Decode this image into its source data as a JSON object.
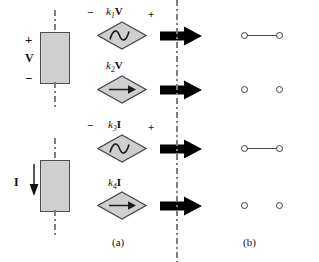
{
  "figure": {
    "captions": [
      {
        "name": "caption-a",
        "text": "(a)",
        "x": 112,
        "y": 236
      },
      {
        "name": "caption-b",
        "text": "(b)",
        "x": 243,
        "y": 236
      }
    ],
    "divider": {
      "name": "vertical-dash-dot-divider",
      "x": 176,
      "color": "#7d7d7d"
    }
  },
  "excitations": [
    {
      "name": "voltage-excitation-block",
      "quantity_label": "V",
      "plus_sign": "+",
      "minus_sign": "−",
      "box": {
        "x": 40,
        "y": 32,
        "w": 30,
        "h": 52,
        "fill": "#cfcfcf",
        "stroke": "#4d4d4d"
      },
      "lead_top": {
        "x": 55,
        "y": 12,
        "h": 22
      },
      "lead_bottom": {
        "x": 55,
        "y": 82,
        "h": 24
      }
    },
    {
      "name": "current-excitation-block",
      "quantity_label": "I",
      "arrow_direction": "down",
      "box": {
        "x": 40,
        "y": 160,
        "w": 30,
        "h": 52,
        "fill": "#cfcfcf",
        "stroke": "#4d4d4d"
      },
      "lead_top": {
        "x": 55,
        "y": 140,
        "h": 22
      },
      "lead_bottom": {
        "x": 55,
        "y": 210,
        "h": 24
      }
    }
  ],
  "rows": [
    {
      "name": "row-1-vcvs",
      "y": 35,
      "source": {
        "name": "dependent-voltage-source-k1v",
        "kind": "voltage",
        "glyph": "sine-wave-icon",
        "coefficient": "k",
        "subscript": "1",
        "variable": "V",
        "label_x": 108,
        "label_y": 7,
        "minus_sign": "−",
        "plus_sign": "+",
        "minus_x": 88,
        "plus_x": 147,
        "sign_y": 8
      },
      "arrow": {
        "name": "transform-arrow-1",
        "x": 162,
        "y": 27
      },
      "result": {
        "name": "short-circuit-result-1",
        "kind": "short-circuit",
        "terminal_left_x": 243,
        "terminal_right_x": 278,
        "connected": true
      }
    },
    {
      "name": "row-2-vccs",
      "y": 89,
      "source": {
        "name": "dependent-current-source-k2v",
        "kind": "current",
        "glyph": "right-arrow-icon",
        "coefficient": "k",
        "subscript": "2",
        "variable": "V",
        "label_x": 108,
        "label_y": 61,
        "minus_sign": "",
        "plus_sign": "",
        "minus_x": 0,
        "plus_x": 0,
        "sign_y": 0
      },
      "arrow": {
        "name": "transform-arrow-2",
        "x": 162,
        "y": 81
      },
      "result": {
        "name": "open-circuit-result-2",
        "kind": "open-circuit",
        "terminal_left_x": 243,
        "terminal_right_x": 278,
        "connected": false
      }
    },
    {
      "name": "row-3-cccs-voltage",
      "y": 148,
      "source": {
        "name": "dependent-voltage-source-k3i",
        "kind": "voltage",
        "glyph": "sine-wave-icon",
        "coefficient": "k",
        "subscript": "3",
        "variable": "I",
        "label_x": 110,
        "label_y": 120,
        "minus_sign": "−",
        "plus_sign": "+",
        "minus_x": 88,
        "plus_x": 147,
        "sign_y": 121
      },
      "arrow": {
        "name": "transform-arrow-3",
        "x": 162,
        "y": 140
      },
      "result": {
        "name": "short-circuit-result-3",
        "kind": "short-circuit",
        "terminal_left_x": 243,
        "terminal_right_x": 278,
        "connected": true
      }
    },
    {
      "name": "row-4-cccs-current",
      "y": 205,
      "source": {
        "name": "dependent-current-source-k4i",
        "kind": "current",
        "glyph": "right-arrow-icon",
        "coefficient": "k",
        "subscript": "4",
        "variable": "I",
        "label_x": 110,
        "label_y": 178,
        "minus_sign": "",
        "plus_sign": "",
        "minus_x": 0,
        "plus_x": 0,
        "sign_y": 0
      },
      "arrow": {
        "name": "transform-arrow-4",
        "x": 162,
        "y": 197
      },
      "result": {
        "name": "open-circuit-result-4",
        "kind": "open-circuit",
        "terminal_left_x": 243,
        "terminal_right_x": 278,
        "connected": false
      }
    }
  ]
}
